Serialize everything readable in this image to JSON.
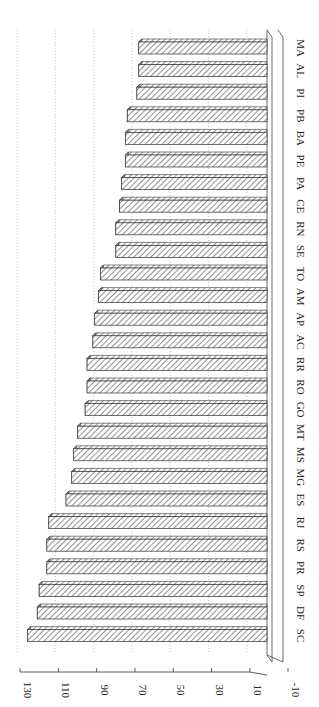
{
  "chart_data": {
    "type": "bar",
    "orientation": "rotated-90-clockwise (vertical bars rendered sideways, 3D style with hatched fill)",
    "title": "",
    "xlabel": "",
    "ylabel": "",
    "categories": [
      "SC",
      "DF",
      "SP",
      "PR",
      "RS",
      "RJ",
      "ES",
      "MG",
      "MS",
      "MT",
      "GO",
      "RO",
      "RR",
      "AC",
      "AP",
      "AM",
      "TO",
      "SE",
      "RN",
      "CE",
      "PA",
      "PE",
      "BA",
      "PB",
      "PI",
      "AL",
      "MA"
    ],
    "values": [
      126,
      121,
      120,
      116,
      116,
      115,
      106,
      103,
      102,
      100,
      96,
      95,
      95,
      92,
      91,
      89,
      88,
      80,
      80,
      78,
      77,
      75,
      75,
      74,
      69,
      68,
      68
    ],
    "ylim": [
      -10,
      130
    ],
    "yticks": [
      -10,
      10,
      30,
      50,
      70,
      90,
      110,
      130
    ],
    "ytick_labels": [
      "-10",
      "10",
      "30",
      "50",
      "70",
      "90",
      "110",
      "130"
    ],
    "grid": true,
    "legend": null,
    "style": {
      "bar_fill": "diagonal-hatch",
      "bar_stroke": "#333333",
      "grid_color": "#bbbbbb",
      "three_d": true
    }
  }
}
